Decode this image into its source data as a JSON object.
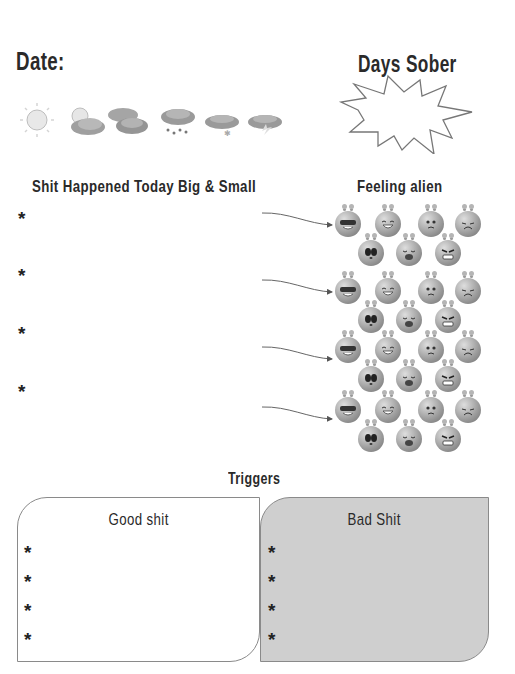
{
  "header": {
    "date_label": "Date:",
    "days_sober_label": "Days Sober"
  },
  "weather": {
    "icons": [
      "sun-icon",
      "partly-cloudy-icon",
      "cloudy-icon",
      "rain-icon",
      "snow-icon",
      "storm-icon"
    ]
  },
  "sections": {
    "shit_happened": {
      "title": "Shit Happened Today Big & Small",
      "bullet": "*",
      "items": [
        "",
        "",
        "",
        ""
      ]
    },
    "feeling_alien": {
      "title": "Feeling alien",
      "groups": 4,
      "faces": [
        "cool",
        "laughing",
        "worried",
        "sad",
        "shocked",
        "crying",
        "angry"
      ]
    },
    "triggers": {
      "title": "Triggers",
      "good": {
        "title": "Good shit",
        "bullet": "*",
        "items": [
          "",
          "",
          "",
          ""
        ]
      },
      "bad": {
        "title": "Bad Shit",
        "bullet": "*",
        "items": [
          "",
          "",
          "",
          ""
        ]
      }
    }
  },
  "colors": {
    "bad_box_bg": "#cfcfcf",
    "border": "#8a8a8a",
    "ink": "#2a2a2a"
  }
}
